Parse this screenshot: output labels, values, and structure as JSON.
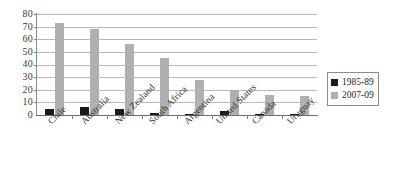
{
  "chart_data": {
    "type": "bar",
    "title": "",
    "subtitle": "",
    "xlabel": "",
    "ylabel": "",
    "ylim": [
      0,
      80
    ],
    "ytick_step": 10,
    "yticks": [
      "80",
      "70",
      "60",
      "50",
      "40",
      "30",
      "20",
      "10",
      "0"
    ],
    "grid": true,
    "legend_position": "right",
    "categories": [
      "Chile",
      "Australia",
      "New Zealand",
      "South Africa",
      "Argentina",
      "United States",
      "Canada",
      "Uruguay"
    ],
    "series": [
      {
        "name": "1985-89",
        "color": "#1a1a1a",
        "values": [
          5,
          6,
          5,
          1.5,
          1,
          3,
          0.5,
          1
        ]
      },
      {
        "name": "2007-09",
        "color": "#b0b0b0",
        "values": [
          73,
          68,
          56,
          45,
          28,
          20,
          16,
          15
        ]
      }
    ]
  },
  "legend": {
    "items": [
      {
        "label": "1985-89",
        "swatch": "legend-swatch-black"
      },
      {
        "label": "2007-09",
        "swatch": "legend-swatch-gray"
      }
    ]
  },
  "colors": {
    "series_1985_89": "#1a1a1a",
    "series_2007_09": "#b0b0b0",
    "gridline": "#b9b9b9",
    "axis": "#8a8a8a",
    "background": "#ffffff"
  }
}
